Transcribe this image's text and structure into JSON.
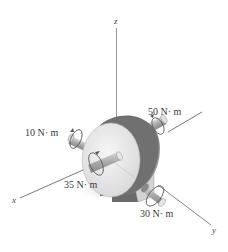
{
  "figure": {
    "axes": {
      "x_label": "x",
      "y_label": "y",
      "z_label": "z"
    },
    "moments": [
      {
        "id": "m50",
        "label": "50 N· m",
        "axis": "y",
        "location": "rear shaft"
      },
      {
        "id": "m10",
        "label": "10 N· m",
        "axis": "x",
        "location": "left rear shaft"
      },
      {
        "id": "m35",
        "label": "35 N· m",
        "axis": "x",
        "location": "front shaft"
      },
      {
        "id": "m30",
        "label": "30 N· m",
        "axis": "y",
        "location": "base shaft"
      }
    ],
    "colors": {
      "background": "#ffffff",
      "axis_line": "#555555",
      "disk_face": "#e8e8e8",
      "disk_rim": "#6e6e6e",
      "shaft": "#b8b8b8",
      "block": "#cfcfcf",
      "label_text": "#3a3a3a"
    }
  }
}
